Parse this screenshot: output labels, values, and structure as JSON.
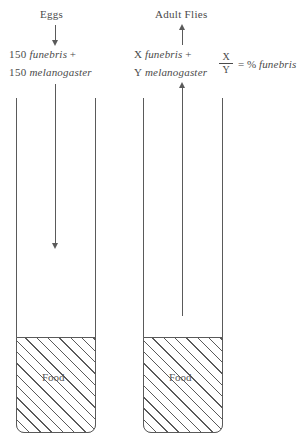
{
  "figure": {
    "type": "experimental-setup-diagram"
  },
  "left_panel": {
    "heading": "Eggs",
    "input_arrow_direction": "down",
    "rows": [
      {
        "count": "150",
        "species": "funebris",
        "operator": "+"
      },
      {
        "count": "150",
        "species": "melanogaster",
        "operator": ""
      }
    ],
    "tube": {
      "food_label": "Food",
      "flow_arrow_direction": "down"
    }
  },
  "right_panel": {
    "heading": "Adult  Flies",
    "output_arrow_direction": "up",
    "rows": [
      {
        "count": "X",
        "species": "funebris",
        "operator": "+"
      },
      {
        "count": "Y",
        "species": "melanogaster",
        "operator": ""
      }
    ],
    "tube": {
      "food_label": "Food",
      "flow_arrow_direction": "up"
    }
  },
  "formula": {
    "numerator": "X",
    "denominator": "Y",
    "equals": "=",
    "percent_symbol": "%",
    "result_species": "funebris"
  },
  "colors": {
    "stroke": "#5a5a5a",
    "text": "#4a4a4a",
    "background": "#ffffff"
  }
}
